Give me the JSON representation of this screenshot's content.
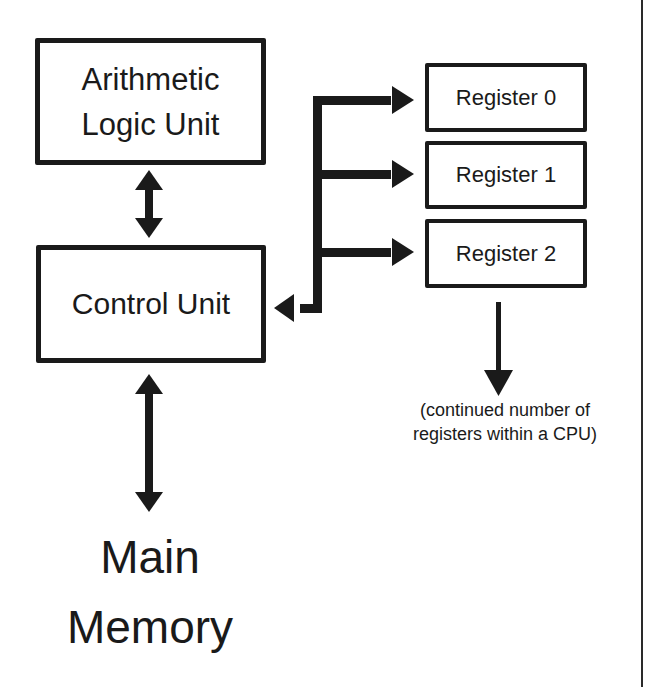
{
  "diagram": {
    "alu": {
      "line1": "Arithmetic",
      "line2": "Logic Unit"
    },
    "control_unit": {
      "label": "Control Unit"
    },
    "registers": [
      {
        "label": "Register 0"
      },
      {
        "label": "Register 1"
      },
      {
        "label": "Register 2"
      }
    ],
    "registers_note": {
      "line1": "(continued number of",
      "line2": "registers within a CPU)"
    },
    "main_memory": {
      "line1": "Main",
      "line2": "Memory"
    },
    "colors": {
      "ink": "#1a1a1a",
      "background": "#ffffff"
    }
  }
}
